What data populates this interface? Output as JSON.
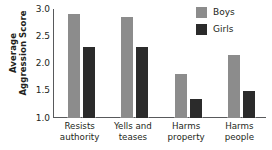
{
  "chart_data": {
    "type": "bar",
    "title": "",
    "xlabel": "",
    "ylabel": "Average Aggression Score",
    "ylabel_line1": "Average",
    "ylabel_line2": "Aggression Score",
    "categories": [
      "Resists authority",
      "Yells and teases",
      "Harms property",
      "Harms people"
    ],
    "category_lines": [
      [
        "Resists",
        "authority"
      ],
      [
        "Yells and",
        "teases"
      ],
      [
        "Harms",
        "property"
      ],
      [
        "Harms",
        "people"
      ]
    ],
    "series": [
      {
        "name": "Boys",
        "color": "#8c8c8c",
        "values": [
          2.9,
          2.85,
          1.8,
          2.15
        ]
      },
      {
        "name": "Girls",
        "color": "#2b2b2b",
        "values": [
          2.3,
          2.3,
          1.35,
          1.5
        ]
      }
    ],
    "ylim": [
      1.0,
      3.0
    ],
    "ytick_values": [
      3.0,
      2.5,
      2.0,
      1.5,
      1.0
    ],
    "ytick_labels": [
      "3.0",
      "2.5",
      "2.0",
      "1.5",
      "1.0"
    ],
    "grid": false,
    "legend_position": "top-right"
  },
  "legend": {
    "entries": [
      {
        "label": "Boys",
        "color": "#8c8c8c"
      },
      {
        "label": "Girls",
        "color": "#2b2b2b"
      }
    ]
  }
}
